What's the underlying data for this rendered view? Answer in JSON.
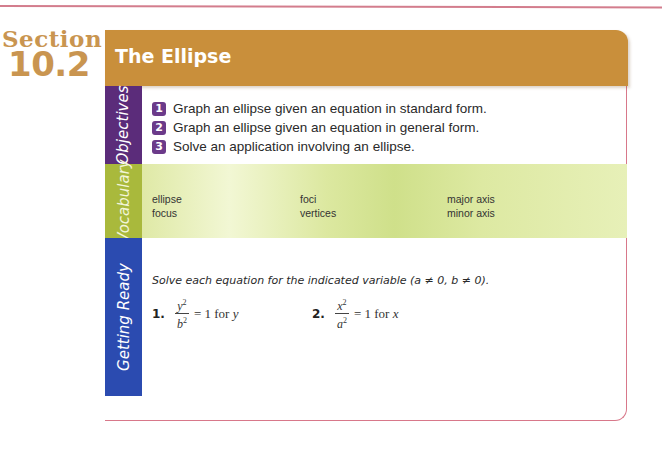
{
  "section": {
    "label": "Section",
    "number": "10.2"
  },
  "header": {
    "title": "The Ellipse"
  },
  "colors": {
    "header": "#c98f3b",
    "section_text": "#c99550",
    "objectives_tab": "#5b2c7a",
    "vocabulary_tab": "#a9b93c",
    "getting_ready_tab": "#2b4bb0",
    "rule": "#d37d8d"
  },
  "objectives": {
    "tab_label": "Objectives",
    "items": [
      {
        "num": "1",
        "text": "Graph an ellipse given an equation in standard form."
      },
      {
        "num": "2",
        "text": "Graph an ellipse given an equation in general form."
      },
      {
        "num": "3",
        "text": "Solve an application involving an ellipse."
      }
    ]
  },
  "vocabulary": {
    "tab_label": "Vocabulary",
    "columns": [
      [
        "ellipse",
        "focus"
      ],
      [
        "foci",
        "vertices"
      ],
      [
        "major axis",
        "minor axis"
      ]
    ]
  },
  "getting_ready": {
    "tab_label": "Getting Ready",
    "instruction": "Solve each equation for the indicated variable (a ≠ 0, b ≠ 0).",
    "problems": [
      {
        "num": "1.",
        "numerator": "y",
        "denominator": "b",
        "exponent": "2",
        "rhs": "= 1 for",
        "var": "y"
      },
      {
        "num": "2.",
        "numerator": "x",
        "denominator": "a",
        "exponent": "2",
        "rhs": "= 1 for",
        "var": "x"
      }
    ]
  }
}
